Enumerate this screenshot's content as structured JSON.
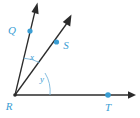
{
  "figure": {
    "background_color": "#ffffff",
    "line_color": "#2b2b2b",
    "accent_color": "#3a9ed4",
    "arc_color": "#7ab8dc"
  },
  "points": {
    "vertex": {
      "label": "R",
      "x": 15,
      "y": 95,
      "label_x": 6,
      "label_y": 109
    },
    "q": {
      "label": "Q",
      "x": 30,
      "y": 31,
      "label_x": 12,
      "label_y": 34
    },
    "s": {
      "label": "S",
      "x": 57,
      "y": 42,
      "label_x": 63,
      "label_y": 49
    },
    "t": {
      "label": "T",
      "x": 108,
      "y": 95,
      "label_x": 105,
      "label_y": 110
    }
  },
  "rays": [
    {
      "name": "ray-RQ",
      "from": "R",
      "through": "Q",
      "tip_x": 37,
      "tip_y": 5
    },
    {
      "name": "ray-RS",
      "from": "R",
      "through": "S",
      "tip_x": 71,
      "tip_y": 17
    },
    {
      "name": "ray-RT",
      "from": "R",
      "through": "T",
      "tip_x": 134,
      "tip_y": 95
    }
  ],
  "angles": [
    {
      "name": "angle-x",
      "label": "x",
      "between": "ray-RQ and ray-RS",
      "label_x": 28,
      "label_y": 60
    },
    {
      "name": "angle-y",
      "label": "y",
      "between": "ray-RS and ray-RT",
      "label_x": 39,
      "label_y": 82
    }
  ]
}
